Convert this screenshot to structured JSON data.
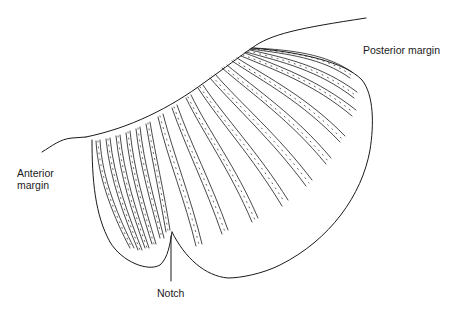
{
  "figure": {
    "stroke_color": "#1a1a1a",
    "background": "#ffffff",
    "labels": {
      "posterior": "Posterior margin",
      "anterior_line1": "Anterior",
      "anterior_line2": "margin",
      "notch": "Notch"
    }
  }
}
